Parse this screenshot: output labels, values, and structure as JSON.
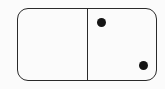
{
  "domino": {
    "left_half": {
      "pips": 0
    },
    "right_half": {
      "pips": 2
    },
    "colors": {
      "outline": "#2a2a2a",
      "pip": "#151515",
      "background": "#fbfbfb"
    }
  }
}
